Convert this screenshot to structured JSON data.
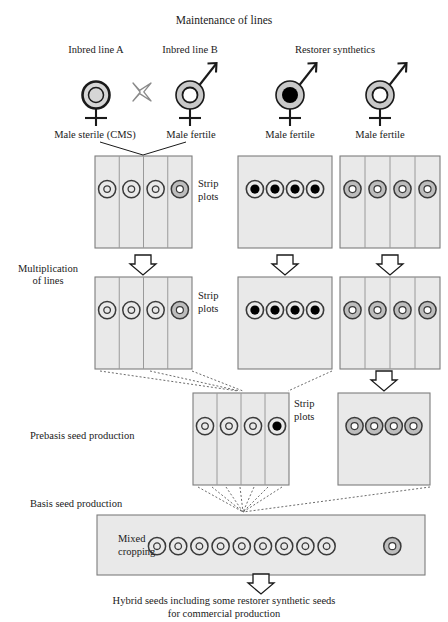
{
  "title": "Maintenance of lines",
  "stage_labels": {
    "multiplication": "Multiplication\nof lines",
    "multiplication_line1": "Multiplication",
    "multiplication_line2": "of lines",
    "prebasis": "Prebasis seed production",
    "basis": "Basis seed production",
    "mixed_line1": "Mixed",
    "mixed_line2": "cropping"
  },
  "strip_label_line1": "Strip",
  "strip_label_line2": "plots",
  "footer": {
    "line1": "Hybrid seeds including some restorer synthetic seeds",
    "line2": "for commercial production"
  },
  "parents": [
    {
      "id": "inbred-a",
      "header": "Inbred line A",
      "caption": "Male sterile (CMS)",
      "symbol": "cms",
      "male": false,
      "female": true,
      "cx": 96,
      "cy": 95
    },
    {
      "id": "inbred-b",
      "header": "Inbred line B",
      "caption": "Male fertile",
      "symbol": "fertile",
      "male": true,
      "female": true,
      "cx": 190,
      "cy": 95
    },
    {
      "id": "restorer-1",
      "header": "Restorer synthetics",
      "caption": "Male fertile",
      "symbol": "restorer-black",
      "male": true,
      "female": true,
      "cx": 290,
      "cy": 95
    },
    {
      "id": "restorer-2",
      "header": "",
      "caption": "Male fertile",
      "symbol": "fertile",
      "male": true,
      "female": true,
      "cx": 380,
      "cy": 95
    }
  ],
  "cross_symbol": {
    "name": "cross-x",
    "cx": 142,
    "cy": 92
  },
  "plots": [
    {
      "id": "plot-a-mult1",
      "x": 95,
      "y": 156,
      "w": 97,
      "h": 92,
      "columns": 4,
      "striped": true,
      "circles": [
        "fertile-outline",
        "fertile-outline",
        "fertile-outline",
        "restorer-ring"
      ],
      "strip_label": true,
      "strip_label_x": 198,
      "strip_label_y": 178
    },
    {
      "id": "plot-r1-mult1",
      "x": 238,
      "y": 156,
      "w": 94,
      "h": 92,
      "columns": 1,
      "striped": false,
      "circles": [
        "restorer-black",
        "restorer-black",
        "restorer-black",
        "restorer-black"
      ],
      "strip_label": false
    },
    {
      "id": "plot-r2-mult1",
      "x": 340,
      "y": 156,
      "w": 100,
      "h": 92,
      "columns": 4,
      "striped": true,
      "circles": [
        "restorer-ring",
        "restorer-ring",
        "restorer-ring",
        "restorer-ring"
      ],
      "strip_label": false
    },
    {
      "id": "plot-a-mult2",
      "x": 95,
      "y": 277,
      "w": 97,
      "h": 92,
      "columns": 4,
      "striped": true,
      "circles": [
        "fertile-outline",
        "fertile-outline",
        "fertile-outline",
        "restorer-ring"
      ],
      "strip_label": true,
      "strip_label_x": 198,
      "strip_label_y": 290
    },
    {
      "id": "plot-r1-mult2",
      "x": 238,
      "y": 277,
      "w": 94,
      "h": 92,
      "columns": 1,
      "striped": false,
      "circles": [
        "restorer-black",
        "restorer-black",
        "restorer-black",
        "restorer-black"
      ],
      "strip_label": false
    },
    {
      "id": "plot-r2-mult2",
      "x": 340,
      "y": 277,
      "w": 100,
      "h": 92,
      "columns": 4,
      "striped": true,
      "circles": [
        "restorer-ring",
        "restorer-ring",
        "restorer-ring",
        "restorer-ring"
      ],
      "strip_label": false
    },
    {
      "id": "plot-prebasis",
      "x": 193,
      "y": 393,
      "w": 96,
      "h": 92,
      "columns": 4,
      "striped": true,
      "circles": [
        "fertile-outline",
        "fertile-outline",
        "fertile-outline",
        "restorer-black"
      ],
      "strip_label": true,
      "strip_label_x": 294,
      "strip_label_y": 398
    },
    {
      "id": "plot-r-prebasis",
      "x": 338,
      "y": 393,
      "w": 92,
      "h": 92,
      "columns": 1,
      "striped": false,
      "circles": [
        "restorer-ring",
        "restorer-ring",
        "restorer-ring",
        "restorer-ring"
      ],
      "strip_label": false
    }
  ],
  "basis_plot": {
    "id": "plot-basis",
    "x": 97,
    "y": 515,
    "w": 328,
    "h": 60,
    "group_count": 9,
    "separated_count": 1,
    "group_symbol": "fertile-outline",
    "separated_symbol": "restorer-ring"
  },
  "arrows": [
    {
      "id": "arrow-mult-a",
      "cx": 143,
      "cy": 264
    },
    {
      "id": "arrow-mult-r1",
      "cx": 285,
      "cy": 264
    },
    {
      "id": "arrow-mult-r2",
      "cx": 390,
      "cy": 264
    },
    {
      "id": "arrow-prebasis-r",
      "cx": 384,
      "cy": 380
    },
    {
      "id": "arrow-final",
      "cx": 261,
      "cy": 583
    }
  ],
  "colors": {
    "plot_fill": "#e9e9e9",
    "plot_border": "#7d7d7d",
    "divider": "#9a9a9a",
    "symbol_ring_dark": "#1a1a1a",
    "symbol_ring_grey": "#c9c9c9",
    "symbol_core_grey": "#d4d4d4",
    "symbol_core_black": "#000000",
    "text": "#1a1a1a"
  }
}
